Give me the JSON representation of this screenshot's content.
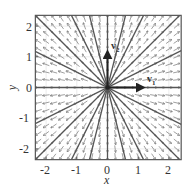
{
  "diagram": {
    "type": "phase_portrait",
    "xlabel": "x",
    "ylabel": "y",
    "xticks": [
      "-2",
      "-1",
      "0",
      "1",
      "2"
    ],
    "yticks": [
      "2",
      "1",
      "0",
      "-1",
      "-2"
    ],
    "xlim": [
      -2.35,
      2.4
    ],
    "ylim": [
      -2.35,
      2.35
    ],
    "eigenvectors": [
      {
        "label": "v",
        "subscript": "1",
        "direction": [
          1,
          0
        ]
      },
      {
        "label": "v",
        "subscript": "2",
        "direction": [
          0,
          1
        ]
      }
    ],
    "colors": {
      "frame": "#555555",
      "lines": "#555555",
      "arrows": "#777777",
      "grid": "#dddddd",
      "eigen": "#222222"
    }
  }
}
